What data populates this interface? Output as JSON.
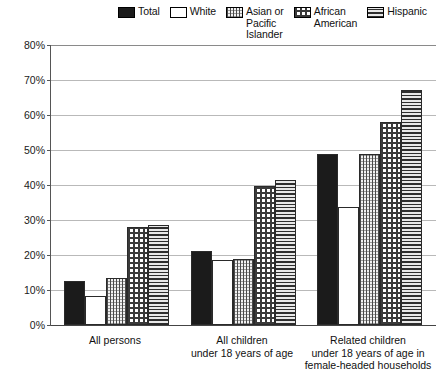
{
  "legend": {
    "items": [
      {
        "label": "Total",
        "pattern": "solid-black",
        "swatch_class": "p-total"
      },
      {
        "label": "White",
        "pattern": "empty-white",
        "swatch_class": "p-white"
      },
      {
        "label": "Asian or\nPacific\nIslander",
        "pattern": "vertical-lines",
        "swatch_class": "p-asian"
      },
      {
        "label": "African\nAmerican",
        "pattern": "dotted-grid",
        "swatch_class": "p-african"
      },
      {
        "label": "Hispanic",
        "pattern": "horizontal-lines",
        "swatch_class": "p-hispanic"
      }
    ]
  },
  "chart_data": {
    "type": "bar",
    "title": "",
    "xlabel": "",
    "ylabel": "",
    "ylim": [
      0,
      80
    ],
    "yticks": [
      "0%",
      "10%",
      "20%",
      "30%",
      "40%",
      "50%",
      "60%",
      "70%",
      "80%"
    ],
    "ytick_values": [
      0,
      10,
      20,
      30,
      40,
      50,
      60,
      70,
      80
    ],
    "grid": true,
    "legend_position": "top",
    "categories": [
      "All persons",
      "All children\nunder 18 years of age",
      "Related children\nunder 18 years of age in\nfemale-headed households"
    ],
    "series": [
      {
        "name": "Total",
        "values": [
          12.7,
          21.2,
          48.9
        ]
      },
      {
        "name": "White",
        "values": [
          8.2,
          18.6,
          33.8
        ]
      },
      {
        "name": "Asian or Pacific Islander",
        "values": [
          13.5,
          18.8,
          48.8
        ]
      },
      {
        "name": "African American",
        "values": [
          27.9,
          39.7,
          57.9
        ]
      },
      {
        "name": "Hispanic",
        "values": [
          28.6,
          41.3,
          67.1
        ]
      }
    ]
  }
}
